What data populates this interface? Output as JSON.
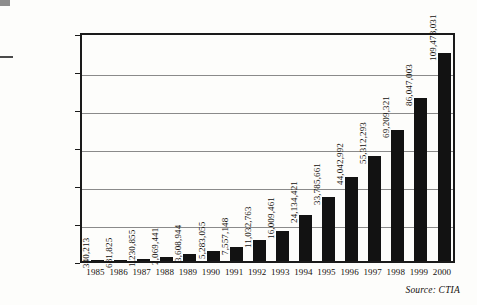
{
  "chart_data": {
    "type": "bar",
    "title": "",
    "subtitle": "",
    "xlabel": "",
    "ylabel": "",
    "categories": [
      "1985",
      "1986",
      "1987",
      "1988",
      "1989",
      "1990",
      "1991",
      "1992",
      "1993",
      "1994",
      "1995",
      "1996",
      "1997",
      "1998",
      "1999",
      "2000"
    ],
    "values": [
      340213,
      681825,
      1230855,
      2069441,
      3608944,
      5283055,
      7557148,
      11032763,
      16009461,
      24134421,
      33785661,
      44042992,
      55312293,
      69209321,
      86047003,
      109478031
    ],
    "value_labels": [
      "340,213",
      "681,825",
      "1,230,855",
      "2,069,441",
      "3,608,944",
      "5,283,055",
      "7,557,148",
      "11,032,763",
      "16,009,461",
      "24,134,421",
      "33,785,661",
      "44,042,992",
      "55,312,293",
      "69,209,321",
      "86,047,003",
      "109,478,031"
    ],
    "ylim": [
      0,
      120000000
    ],
    "yticks": [
      0,
      20000000,
      40000000,
      60000000,
      80000000,
      100000000,
      120000000
    ],
    "ytick_labels": [
      "0",
      "20,000,000",
      "40,000,000",
      "60,000,000",
      "80,000,000",
      "100,000,000",
      "120,000,000"
    ],
    "grid": true,
    "grid_axis": "y",
    "legend": false,
    "bar_color": "#121212",
    "source": "Source: CTIA"
  },
  "footer": {
    "source": "Source: CTIA"
  }
}
